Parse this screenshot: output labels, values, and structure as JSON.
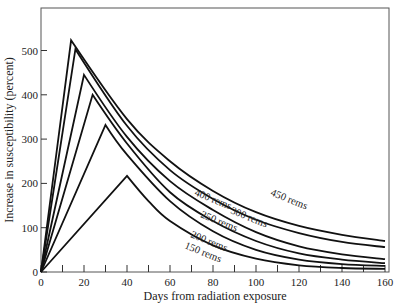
{
  "chart_data": {
    "type": "line",
    "title": "",
    "xlabel": "Days from radiation exposure",
    "ylabel": "Increase in susceptibility (percent)",
    "xlim": [
      0,
      160
    ],
    "ylim": [
      0,
      590
    ],
    "xticks": [
      0,
      20,
      40,
      60,
      80,
      100,
      120,
      140,
      160
    ],
    "xminor": [
      10,
      30,
      50,
      70,
      90,
      110,
      130,
      150
    ],
    "yticks": [
      0,
      100,
      200,
      300,
      400,
      500
    ],
    "grid": false,
    "legend": "inline labels on curves",
    "series": [
      {
        "name": "450 rems",
        "label": "450 rems",
        "peak_day": 14,
        "peak_value": 523,
        "end_value": 70,
        "x": [
          0,
          14,
          40,
          60,
          80,
          100,
          120,
          140,
          160
        ],
        "y": [
          0,
          523,
          345,
          250,
          183,
          135,
          104,
          84,
          70
        ]
      },
      {
        "name": "400 rems",
        "label": "400 rems",
        "peak_day": 16,
        "peak_value": 503,
        "end_value": 56,
        "x": [
          0,
          16,
          40,
          60,
          80,
          100,
          120,
          140,
          160
        ],
        "y": [
          0,
          503,
          330,
          230,
          165,
          118,
          88,
          68,
          56
        ]
      },
      {
        "name": "300 rems",
        "label": "300 rems",
        "peak_day": 20,
        "peak_value": 445,
        "end_value": 29,
        "x": [
          0,
          20,
          40,
          60,
          80,
          100,
          120,
          140,
          160
        ],
        "y": [
          0,
          445,
          305,
          205,
          140,
          90,
          58,
          40,
          29
        ]
      },
      {
        "name": "250 rems",
        "label": "250 rems",
        "peak_day": 24,
        "peak_value": 400,
        "end_value": 20,
        "x": [
          0,
          24,
          40,
          60,
          80,
          100,
          120,
          140,
          160
        ],
        "y": [
          0,
          400,
          290,
          180,
          115,
          70,
          42,
          28,
          20
        ]
      },
      {
        "name": "200 rems",
        "label": "200 rems",
        "peak_day": 30,
        "peak_value": 332,
        "end_value": 14,
        "x": [
          0,
          30,
          40,
          60,
          80,
          100,
          120,
          140,
          160
        ],
        "y": [
          0,
          332,
          265,
          160,
          92,
          50,
          28,
          18,
          14
        ]
      },
      {
        "name": "150 rems",
        "label": "150 rems",
        "peak_day": 40,
        "peak_value": 217,
        "end_value": 7,
        "x": [
          0,
          40,
          50,
          60,
          80,
          100,
          120,
          140,
          160
        ],
        "y": [
          0,
          217,
          160,
          115,
          60,
          30,
          15,
          9,
          7
        ]
      }
    ]
  },
  "labels": {
    "l450": "450 rems",
    "l400": "400 rems",
    "l300": "300 rems",
    "l250": "250 rems",
    "l200": "200 rems",
    "l150": "150 rems"
  }
}
